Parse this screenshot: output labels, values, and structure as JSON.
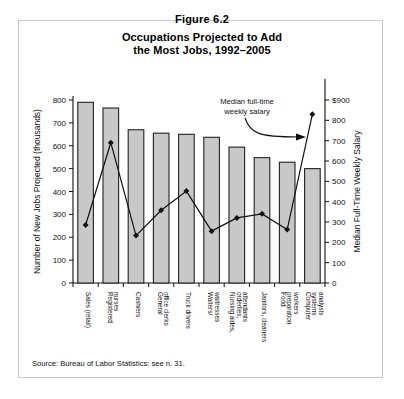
{
  "figure": {
    "number_label": "Figure 6.2",
    "title_line1": "Occupations Projected to Add",
    "title_line2": "the Most Jobs, 1992–2005",
    "source_note": "Source: Bureau of Labor Statistics: see n. 31."
  },
  "annotation": {
    "line1": "Median full-time",
    "line2": "weekly salary"
  },
  "axes": {
    "left_title": "Number of New Jobs Projected (thousands)",
    "right_title": "Median Full-Time Weekly Salary",
    "left_ticks": [
      "0",
      "100",
      "200",
      "300",
      "400",
      "500",
      "600",
      "700",
      "800"
    ],
    "right_ticks": [
      "0",
      "100",
      "200",
      "300",
      "400",
      "500",
      "600",
      "700",
      "800",
      "$900"
    ]
  },
  "colors": {
    "bar_fill": "#c8c8c8",
    "bar_stroke": "#222222",
    "line": "#111111",
    "marker": "#111111",
    "frame": "#c9c9c9",
    "text": "#111111"
  },
  "chart_data": {
    "type": "bar",
    "title": "Occupations Projected to Add the Most Jobs, 1992–2005",
    "xlabel": "",
    "ylabel": "Number of New Jobs Projected (thousands)",
    "y2label": "Median Full-Time Weekly Salary",
    "ylim": [
      0,
      800
    ],
    "y2lim": [
      0,
      900
    ],
    "grid": false,
    "legend": "none",
    "categories": [
      "Sales (retail)",
      "Registered nurses",
      "Cashiers",
      "General office clerks",
      "Truck drivers",
      "Waiters/ waitresses",
      "Nursing aides, orderlies, attendants",
      "Janitors, cleaners",
      "Food preparation workers",
      "Computer systems analysts"
    ],
    "category_lines": [
      [
        "Sales (retail)"
      ],
      [
        "Registered",
        "nurses"
      ],
      [
        "Cashiers"
      ],
      [
        "General",
        "office clerks"
      ],
      [
        "Truck drivers"
      ],
      [
        "Waiters/",
        "waitresses"
      ],
      [
        "Nursing aides,",
        "orderlies,",
        "attendants"
      ],
      [
        "Janitors, cleaners"
      ],
      [
        "Food",
        "preparation",
        "workers"
      ],
      [
        "Computer",
        "systems",
        "analysts"
      ]
    ],
    "series": [
      {
        "name": "Number of New Jobs Projected (thousands)",
        "type": "bar",
        "axis": "left",
        "values": [
          790,
          765,
          670,
          655,
          650,
          637,
          594,
          548,
          528,
          500
        ]
      },
      {
        "name": "Median full-time weekly salary",
        "type": "line",
        "axis": "right",
        "values": [
          285,
          690,
          233,
          358,
          452,
          255,
          320,
          340,
          263,
          830
        ]
      }
    ]
  }
}
